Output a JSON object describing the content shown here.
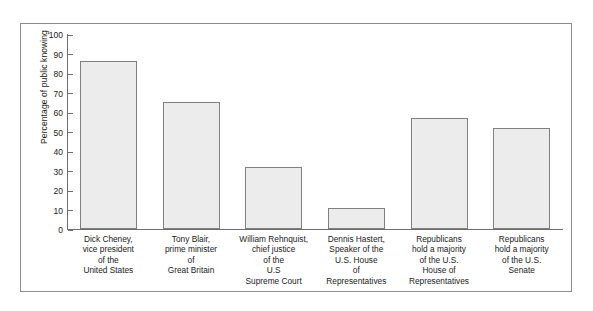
{
  "chart_data": {
    "type": "bar",
    "title": "",
    "xlabel": "",
    "ylabel": "Percentage of public knowing",
    "ylim": [
      0,
      100
    ],
    "grid": false,
    "legend": false,
    "ytick_labels": [
      "100",
      "90",
      "80",
      "70",
      "60",
      "50",
      "40",
      "30",
      "20",
      "10",
      "0"
    ],
    "yticks": [
      100,
      90,
      80,
      70,
      60,
      50,
      40,
      30,
      20,
      10,
      0
    ],
    "categories": [
      "Dick Cheney,\nvice president\nof the\nUnited States",
      "Tony Blair,\nprime minister\nof\nGreat Britain",
      "William Rehnquist,\nchief justice\nof the\nU.S\nSupreme Court",
      "Dennis Hastert,\nSpeaker of the\nU.S. House\nof\nRepresentatives",
      "Republicans\nhold a majority\nof the U.S.\nHouse of\nRepresentatives",
      "Republicans\nhold a majority\nof the U.S.\nSenate"
    ],
    "category_lines": [
      [
        "Dick Cheney,",
        "vice president",
        "of the",
        "United States"
      ],
      [
        "Tony Blair,",
        "prime minister",
        "of",
        "Great Britain"
      ],
      [
        "William Rehnquist,",
        "chief justice",
        "of the",
        "U.S",
        "Supreme Court"
      ],
      [
        "Dennis Hastert,",
        "Speaker of the",
        "U.S. House",
        "of",
        "Representatives"
      ],
      [
        "Republicans",
        "hold a majority",
        "of the U.S.",
        "House of",
        "Representatives"
      ],
      [
        "Republicans",
        "hold a majority",
        "of the U.S.",
        "Senate"
      ]
    ],
    "values": [
      86,
      65,
      32,
      11,
      57,
      52
    ],
    "bar_fill_color": "#ececec",
    "bar_border_color": "#808080",
    "axis_color": "#6e6e6e",
    "frame_color": "#8c8c8c"
  }
}
